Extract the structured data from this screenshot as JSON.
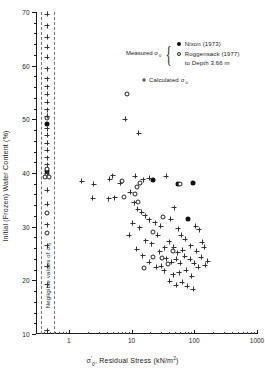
{
  "chart_data": {
    "type": "scatter",
    "title": "",
    "xlabel": "σ'₀, Residual Stress (kN/m²)",
    "ylabel": "Initial (Frozen) Water Content (%)",
    "xscale": "log",
    "xlim": [
      0.3,
      1000
    ],
    "ylim": [
      10,
      70
    ],
    "x_ticks": [
      1,
      10,
      100,
      1000
    ],
    "x_tick_labels": [
      "1",
      "10",
      "100",
      "1000"
    ],
    "y_ticks": [
      10,
      20,
      30,
      40,
      50,
      60,
      70
    ],
    "y_tick_labels": [
      "10",
      "20",
      "30",
      "40",
      "50",
      "60",
      "70"
    ],
    "grid": false,
    "annotation_negligible": "Negligible values of σ'₀",
    "series": [
      {
        "name": "Nixon (1973)",
        "marker": "filled-circle",
        "color": "#111111",
        "points": [
          [
            0.45,
            49.2
          ],
          [
            0.45,
            40.4
          ],
          [
            22,
            38.7
          ],
          [
            55,
            37.9
          ],
          [
            95,
            38.2
          ],
          [
            80,
            31.5
          ]
        ]
      },
      {
        "name": "Roggensack (1977) to Depth 3.66 m",
        "marker": "open-circle",
        "color": "#222222",
        "points": [
          [
            0.45,
            50.2
          ],
          [
            0.45,
            40.8
          ],
          [
            0.45,
            39.6
          ],
          [
            0.42,
            39.2
          ],
          [
            0.48,
            39.3
          ],
          [
            0.45,
            32.6
          ],
          [
            0.45,
            28.9
          ],
          [
            8.5,
            54.8
          ],
          [
            7.0,
            38.6
          ],
          [
            13.5,
            38.2
          ],
          [
            12.0,
            37.3
          ],
          [
            11.5,
            36.0
          ],
          [
            12.5,
            34.6
          ],
          [
            60,
            38.0
          ],
          [
            32,
            31.8
          ],
          [
            22,
            29.0
          ],
          [
            45,
            25.5
          ],
          [
            22,
            24.3
          ],
          [
            31,
            24.2
          ],
          [
            38,
            23.1
          ],
          [
            7.5,
            35.6
          ],
          [
            16,
            22.3
          ]
        ]
      },
      {
        "name": "Calculated σ'₀",
        "marker": "plus",
        "color": "#333333",
        "points": [
          [
            0.45,
            69.6
          ],
          [
            0.45,
            67.4
          ],
          [
            0.45,
            65.3
          ],
          [
            0.45,
            63.4
          ],
          [
            0.45,
            61.6
          ],
          [
            0.45,
            59.4
          ],
          [
            0.45,
            57.6
          ],
          [
            0.45,
            56.1
          ],
          [
            0.45,
            54.7
          ],
          [
            0.45,
            53.2
          ],
          [
            0.45,
            51.8
          ],
          [
            0.45,
            50.6
          ],
          [
            0.45,
            48.2
          ],
          [
            0.45,
            47.0
          ],
          [
            0.45,
            45.5
          ],
          [
            0.45,
            44.2
          ],
          [
            0.45,
            42.8
          ],
          [
            0.45,
            41.5
          ],
          [
            0.45,
            40.0
          ],
          [
            0.45,
            36.8
          ],
          [
            0.45,
            34.2
          ],
          [
            0.45,
            30.4
          ],
          [
            0.45,
            26.4
          ],
          [
            0.45,
            22.6
          ],
          [
            0.45,
            19.2
          ],
          [
            0.45,
            10.6
          ],
          [
            8.0,
            50.0
          ],
          [
            13.0,
            47.4
          ],
          [
            1.6,
            38.5
          ],
          [
            2.5,
            37.9
          ],
          [
            4.5,
            38.8
          ],
          [
            5.0,
            39.5
          ],
          [
            6.6,
            38.1
          ],
          [
            9.5,
            36.4
          ],
          [
            2.4,
            35.3
          ],
          [
            4.3,
            35.2
          ],
          [
            5.4,
            35.4
          ],
          [
            11.5,
            39.4
          ],
          [
            15.5,
            38.7
          ],
          [
            19,
            39.0
          ],
          [
            36,
            39.4
          ],
          [
            11.0,
            34.5
          ],
          [
            12.5,
            33.2
          ],
          [
            14.5,
            32.7
          ],
          [
            16.5,
            32.0
          ],
          [
            19,
            31.3
          ],
          [
            10.5,
            30.6
          ],
          [
            13.5,
            29.8
          ],
          [
            9.2,
            28.4
          ],
          [
            24,
            30.7
          ],
          [
            29,
            30.1
          ],
          [
            26,
            28.4
          ],
          [
            42,
            31.4
          ],
          [
            48,
            33.5
          ],
          [
            56,
            29.6
          ],
          [
            62,
            28.4
          ],
          [
            72,
            27.7
          ],
          [
            105,
            30.1
          ],
          [
            120,
            29.4
          ],
          [
            135,
            27.1
          ],
          [
            88,
            26.4
          ],
          [
            66,
            25.6
          ],
          [
            55,
            25.1
          ],
          [
            47,
            26.2
          ],
          [
            40,
            27.2
          ],
          [
            34,
            26.1
          ],
          [
            28,
            25.3
          ],
          [
            36,
            24.0
          ],
          [
            44,
            23.4
          ],
          [
            52,
            23.9
          ],
          [
            60,
            23.2
          ],
          [
            70,
            24.5
          ],
          [
            86,
            23.9
          ],
          [
            100,
            23.2
          ],
          [
            116,
            22.4
          ],
          [
            74,
            21.9
          ],
          [
            58,
            21.4
          ],
          [
            46,
            21.0
          ],
          [
            33,
            21.8
          ],
          [
            25,
            22.4
          ],
          [
            19,
            23.4
          ],
          [
            15,
            24.6
          ],
          [
            12,
            25.8
          ],
          [
            21,
            26.8
          ],
          [
            17,
            27.4
          ],
          [
            30,
            22.6
          ],
          [
            92,
            20.8
          ],
          [
            64,
            19.6
          ],
          [
            110,
            25.4
          ],
          [
            130,
            24.3
          ],
          [
            150,
            22.8
          ],
          [
            78,
            18.9
          ],
          [
            96,
            18.3
          ],
          [
            41,
            19.8
          ],
          [
            52,
            19.1
          ],
          [
            145,
            26.2
          ],
          [
            163,
            23.6
          ]
        ]
      }
    ]
  },
  "legend": {
    "measured_label": "Measured",
    "measured_symbol_sigma": "σ",
    "measured_symbol_prime": "'",
    "measured_symbol_sub": "0",
    "entries": [
      {
        "marker": "filled-circle",
        "text": "Nixon (1973)"
      },
      {
        "marker": "open-circle",
        "text": "Roggensack (1977)"
      }
    ],
    "sub_line": "to Depth 3.66 m",
    "calculated": {
      "marker": "plus",
      "text": "Calculated",
      "symbol_sigma": "σ",
      "symbol_prime": "'",
      "symbol_sub": "0"
    }
  },
  "axes": {
    "y_title_text": "Initial (Frozen) Water Content (%)",
    "x_title_text": ", Residual Stress (kN/m",
    "x_title_sigma": "σ",
    "x_title_prime": "'",
    "x_title_sub": "0",
    "x_title_exp": "2",
    "x_title_tail": ")",
    "negligible_text": "Negligible values of",
    "negligible_sigma": "σ",
    "negligible_prime": "'",
    "negligible_sub": "0"
  }
}
